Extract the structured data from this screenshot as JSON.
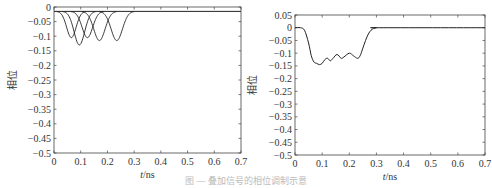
{
  "chart_data": [
    {
      "type": "line",
      "title": "",
      "xlabel": "t/ns",
      "ylabel": "相位",
      "xlim": [
        0,
        0.7
      ],
      "ylim": [
        -0.5,
        0
      ],
      "xticks": [
        "0",
        "0.1",
        "0.2",
        "0.3",
        "0.4",
        "0.5",
        "0.6",
        "0.7"
      ],
      "yticks": [
        "0",
        "-0.05",
        "-0.1",
        "-0.15",
        "-0.2",
        "-0.25",
        "-0.3",
        "-0.35",
        "-0.4",
        "-0.45",
        "-0.5"
      ],
      "grid": false,
      "legend": null,
      "baseline": -0.015,
      "series": [
        {
          "name": "pulse1",
          "center": 0.065,
          "min": -0.105,
          "width": 0.025
        },
        {
          "name": "pulse2",
          "center": 0.095,
          "min": -0.13,
          "width": 0.028
        },
        {
          "name": "pulse3",
          "center": 0.125,
          "min": -0.105,
          "width": 0.028
        },
        {
          "name": "pulse4",
          "center": 0.17,
          "min": -0.115,
          "width": 0.03
        },
        {
          "name": "pulse5",
          "center": 0.235,
          "min": -0.115,
          "width": 0.03
        }
      ]
    },
    {
      "type": "line",
      "title": "",
      "xlabel": "t/ns",
      "ylabel": "相位",
      "xlim": [
        0,
        0.7
      ],
      "ylim": [
        -0.5,
        0.05
      ],
      "xticks": [
        "0",
        "0.1",
        "0.2",
        "0.3",
        "0.4",
        "0.5",
        "0.6",
        "0.7"
      ],
      "yticks": [
        "0.05",
        "0",
        "-0.05",
        "-0.1",
        "-0.15",
        "-0.2",
        "-0.25",
        "-0.3",
        "-0.35",
        "-0.4",
        "-0.45",
        "-0.5"
      ],
      "grid": false,
      "legend": null,
      "series": [
        {
          "name": "sum",
          "x": [
            0,
            0.02,
            0.035,
            0.05,
            0.06,
            0.07,
            0.08,
            0.09,
            0.1,
            0.11,
            0.12,
            0.13,
            0.14,
            0.155,
            0.17,
            0.18,
            0.2,
            0.215,
            0.23,
            0.24,
            0.25,
            0.26,
            0.27,
            0.28,
            0.29,
            0.3,
            0.31,
            0.7
          ],
          "y": [
            0,
            0,
            -0.01,
            -0.06,
            -0.11,
            -0.135,
            -0.14,
            -0.145,
            -0.14,
            -0.125,
            -0.12,
            -0.13,
            -0.12,
            -0.105,
            -0.12,
            -0.115,
            -0.1,
            -0.11,
            -0.12,
            -0.11,
            -0.08,
            -0.05,
            -0.025,
            -0.01,
            -0.003,
            0,
            0,
            0
          ]
        }
      ]
    }
  ],
  "caption": "图 — 叠加信号的相位调制示意"
}
